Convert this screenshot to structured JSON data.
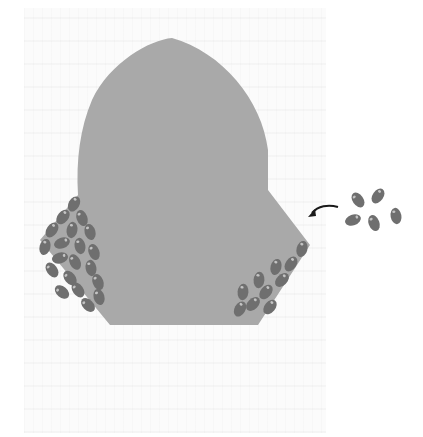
{
  "figure": {
    "colors": {
      "background": "#ffffff",
      "body_fill": "#a9a9a9",
      "bean_fill": "#6f6f6f",
      "bean_highlight": "#b9b9b9",
      "arrow_color": "#1a1a1a"
    },
    "body": {
      "name": "main-body",
      "outline_points": "172,38 ..."
    },
    "clusters": {
      "left": {
        "count": 20
      },
      "right": {
        "count": 10
      }
    },
    "free_beans": {
      "count": 5
    },
    "arrow": {
      "direction": "left",
      "label": ""
    }
  }
}
